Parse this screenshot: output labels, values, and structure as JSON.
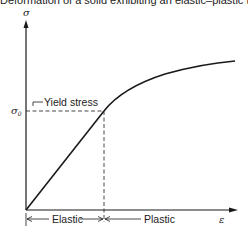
{
  "figure": {
    "title": "Deformation of a solid exhibiting an elastic–plastic transform",
    "y_axis_label": "σ",
    "x_axis_label": "ε",
    "yield_level_label": "σ",
    "yield_level_subscript": "0",
    "yield_annotation": "Yield stress",
    "regions": [
      {
        "label": "Elastic"
      },
      {
        "label": "Plastic"
      }
    ]
  },
  "colors": {
    "line": "#1a1a1a",
    "background": "#ffffff"
  }
}
